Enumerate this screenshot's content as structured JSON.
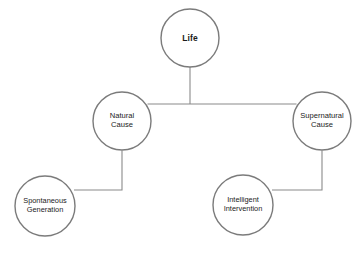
{
  "diagram": {
    "background_color": "#ffffff",
    "node_fill": "#ffffff",
    "node_stroke": "#7b7b7b",
    "connector_color": "#8a8a8a",
    "text_color": "#1b1b1b",
    "nodes": [
      {
        "id": "life",
        "label": "Life",
        "level": "root",
        "cx": 190,
        "cy": 38,
        "r": 29
      },
      {
        "id": "natural-cause",
        "label": "Natural\nCause",
        "level": "branch",
        "cx": 122,
        "cy": 121,
        "r": 29
      },
      {
        "id": "supernatural-cause",
        "label": "Supernatural\nCause",
        "level": "branch",
        "cx": 322,
        "cy": 121,
        "r": 29
      },
      {
        "id": "spontaneous-generation",
        "label": "Spontaneous\nGeneration",
        "level": "leaf",
        "cx": 45,
        "cy": 206,
        "r": 30
      },
      {
        "id": "intelligent-intervention",
        "label": "Intelligent\nIntervention",
        "level": "leaf",
        "cx": 243,
        "cy": 205,
        "r": 30
      }
    ],
    "edges": [
      {
        "id": "life-to-split",
        "from": "life",
        "to": "split-point"
      },
      {
        "id": "split-to-natural-cause",
        "from": "split-point",
        "to": "natural-cause"
      },
      {
        "id": "split-to-supernatural-cause",
        "from": "split-point",
        "to": "supernatural-cause"
      },
      {
        "id": "natural-to-spontaneous-generation",
        "from": "natural-cause",
        "to": "spontaneous-generation"
      },
      {
        "id": "supernatural-to-intelligent-intervention",
        "from": "supernatural-cause",
        "to": "intelligent-intervention"
      }
    ]
  }
}
